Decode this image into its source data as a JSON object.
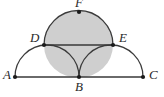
{
  "figure": {
    "background_color": "#ffffff",
    "stroke_color": "#3a3a3a",
    "shade_color": "#cfcfcf",
    "point_color": "#1a1a1a",
    "labels": {
      "A": "A",
      "B": "B",
      "C": "C",
      "D": "D",
      "E": "E",
      "F": "F"
    },
    "points": [
      {
        "id": "A",
        "label": "A",
        "x": 15,
        "y": 77
      },
      {
        "id": "B",
        "label": "B",
        "x": 79,
        "y": 77
      },
      {
        "id": "C",
        "label": "C",
        "x": 143,
        "y": 77
      },
      {
        "id": "D",
        "label": "D",
        "x": 44,
        "y": 45
      },
      {
        "id": "E",
        "label": "E",
        "x": 113,
        "y": 45
      },
      {
        "id": "F",
        "label": "F",
        "x": 79,
        "y": 12
      }
    ],
    "segments": [
      {
        "id": "AC",
        "from": "A",
        "to": "C"
      },
      {
        "id": "DE",
        "from": "D",
        "to": "E"
      }
    ],
    "arcs": [
      {
        "id": "arc-AB",
        "from": "A",
        "to": "B",
        "radius": 32
      },
      {
        "id": "arc-BC",
        "from": "B",
        "to": "C",
        "radius": 32
      },
      {
        "id": "arc-DFE",
        "from": "D",
        "to": "E",
        "through": "F",
        "radius": 35
      }
    ],
    "shaded_regions": [
      {
        "id": "upper-semicircle-DFE",
        "description": "semicircle on DE through F"
      },
      {
        "id": "curvilinear-triangle-DBE",
        "description": "region bounded by DE and arcs DB and BE"
      }
    ]
  }
}
